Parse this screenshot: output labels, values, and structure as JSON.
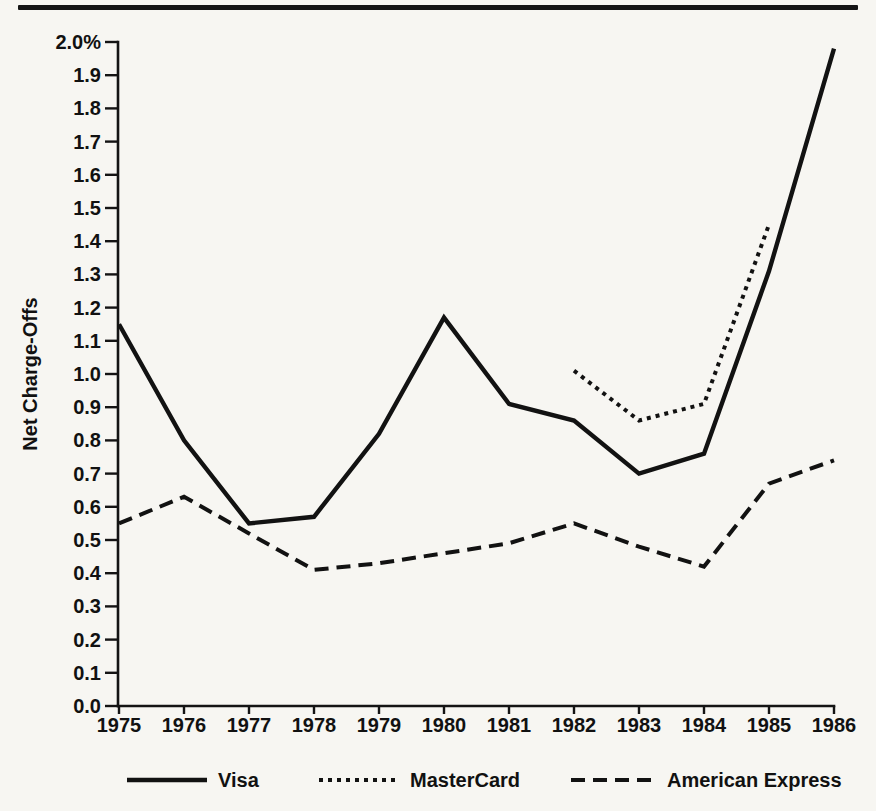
{
  "page": {
    "background": "#f7f6f2",
    "ink": "#111111",
    "top_rule_color": "#151515"
  },
  "chart_data": {
    "type": "line",
    "title": "",
    "xlabel": "",
    "ylabel": "Net Charge-Offs",
    "x": [
      1975,
      1976,
      1977,
      1978,
      1979,
      1980,
      1981,
      1982,
      1983,
      1984,
      1985,
      1986
    ],
    "ylim": [
      0.0,
      2.0
    ],
    "y_tick_step": 0.1,
    "y_ticks": [
      "2.0%",
      "1.9",
      "1.8",
      "1.7",
      "1.6",
      "1.5",
      "1.4",
      "1.3",
      "1.2",
      "1.1",
      "1.0",
      "0.9",
      "0.8",
      "0.7",
      "0.6",
      "0.5",
      "0.4",
      "0.3",
      "0.2",
      "0.1",
      "0.0"
    ],
    "grid": false,
    "legend_position": "bottom",
    "series": [
      {
        "name": "Visa",
        "style": "solid",
        "values": [
          1.15,
          0.8,
          0.55,
          0.57,
          0.82,
          1.17,
          0.91,
          0.86,
          0.7,
          0.76,
          1.31,
          1.98
        ]
      },
      {
        "name": "MasterCard",
        "style": "dotted",
        "values": [
          null,
          null,
          null,
          null,
          null,
          null,
          null,
          1.01,
          0.86,
          0.91,
          1.45,
          null
        ]
      },
      {
        "name": "American Express",
        "style": "dashed",
        "values": [
          0.55,
          0.63,
          0.52,
          0.41,
          0.43,
          0.46,
          0.49,
          0.55,
          0.48,
          0.42,
          0.67,
          0.74
        ]
      }
    ]
  }
}
